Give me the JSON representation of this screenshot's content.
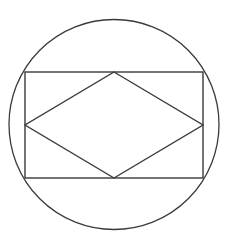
{
  "diagram": {
    "stroke_color": "#3a3a3a",
    "background": "#ffffff",
    "circle": {
      "cx": 114,
      "cy": 124.5,
      "r": 105
    },
    "rectangle": {
      "x": 25,
      "y": 72,
      "width": 178,
      "height": 106
    },
    "rhombus": {
      "points": [
        [
          114,
          72
        ],
        [
          203,
          125
        ],
        [
          114,
          178
        ],
        [
          25,
          125
        ]
      ]
    }
  }
}
